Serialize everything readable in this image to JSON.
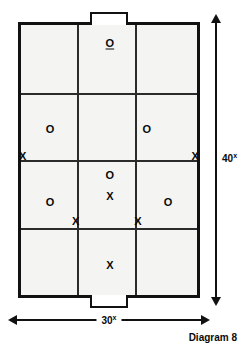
{
  "diagram": {
    "caption": "Diagram 8",
    "field": {
      "label": "playing-field",
      "rows": 4,
      "columns": 3,
      "fill_color": "#f4f4f2",
      "border_color": "#111111",
      "row_boundaries_percent": [
        0,
        25,
        50,
        75,
        100
      ],
      "column_boundaries_percent": [
        0,
        32,
        65,
        100
      ]
    },
    "goals": [
      {
        "name": "goal-top",
        "position": "top",
        "label": "top-goal"
      },
      {
        "name": "goal-bottom",
        "position": "bottom",
        "label": "bottom-goal"
      }
    ],
    "dimensions": {
      "vertical": {
        "value": "40",
        "unit": "x",
        "orientation": "vertical",
        "arrowheads": "both"
      },
      "horizontal": {
        "value": "30",
        "unit": "x",
        "orientation": "horizontal",
        "arrowheads": "both"
      }
    },
    "markers": [
      {
        "id": "o-top-center",
        "symbol": "O",
        "team": "O",
        "x_percent": 50.5,
        "y_percent": 6.5,
        "underlined": true
      },
      {
        "id": "o-row2-left",
        "symbol": "O",
        "team": "O",
        "x_percent": 16.5,
        "y_percent": 38.5,
        "underlined": false
      },
      {
        "id": "o-row2-right",
        "symbol": "O",
        "team": "O",
        "x_percent": 71.5,
        "y_percent": 38.5,
        "underlined": false
      },
      {
        "id": "x-row2-left-edge",
        "symbol": "X",
        "team": "X",
        "x_percent": 1.0,
        "y_percent": 48.5,
        "underlined": false
      },
      {
        "id": "x-row2-right-edge",
        "symbol": "X",
        "team": "X",
        "x_percent": 99.0,
        "y_percent": 48.5,
        "underlined": false
      },
      {
        "id": "o-row3-center-top",
        "symbol": "O",
        "team": "O",
        "x_percent": 50.5,
        "y_percent": 55.5,
        "underlined": false
      },
      {
        "id": "x-row3-center",
        "symbol": "X",
        "team": "X",
        "x_percent": 50.5,
        "y_percent": 63.5,
        "underlined": false
      },
      {
        "id": "o-row3-left",
        "symbol": "O",
        "team": "O",
        "x_percent": 16.5,
        "y_percent": 65.5,
        "underlined": false
      },
      {
        "id": "o-row3-right",
        "symbol": "O",
        "team": "O",
        "x_percent": 83.5,
        "y_percent": 65.5,
        "underlined": false
      },
      {
        "id": "x-row3-left-inner",
        "symbol": "X",
        "team": "X",
        "x_percent": 31.0,
        "y_percent": 72.5,
        "underlined": false
      },
      {
        "id": "x-row3-right-inner",
        "symbol": "X",
        "team": "X",
        "x_percent": 66.5,
        "y_percent": 72.5,
        "underlined": false
      },
      {
        "id": "x-row4-center",
        "symbol": "X",
        "team": "X",
        "x_percent": 50.5,
        "y_percent": 89.0,
        "underlined": false
      }
    ]
  }
}
